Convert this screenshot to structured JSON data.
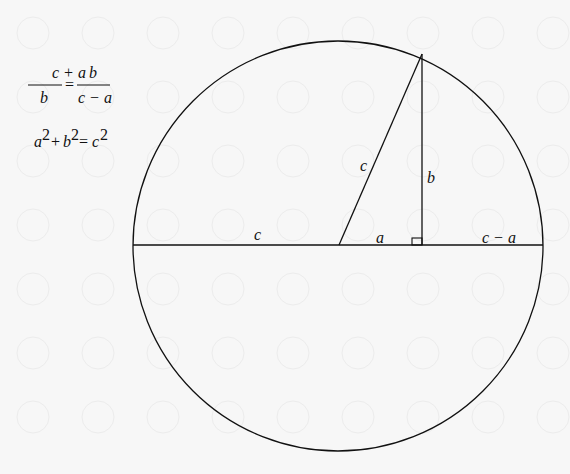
{
  "equations": {
    "eq1": {
      "num_left": "c + a",
      "den_left": "b",
      "equals": "=",
      "num_right": "b",
      "den_right": "c − a"
    },
    "eq2": {
      "a": "a",
      "a_exp": "2",
      "plus": "+",
      "b": "b",
      "b_exp": "2",
      "equals": "=",
      "c": "c",
      "c_exp": "2"
    }
  },
  "diagram": {
    "labels": {
      "left_radius": "c",
      "hypotenuse": "c",
      "height": "b",
      "base": "a",
      "right_segment": "c − a"
    },
    "stroke_color": "#111111",
    "background": "#f7f7f7"
  }
}
